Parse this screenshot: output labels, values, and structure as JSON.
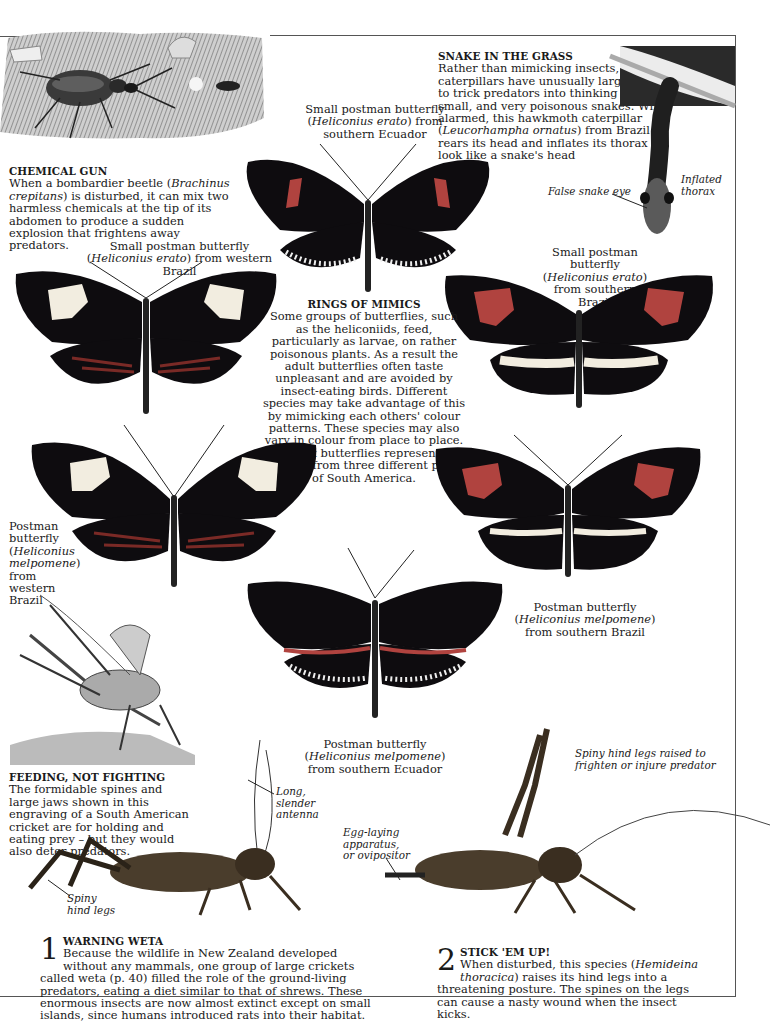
{
  "page": {
    "chemical_gun": {
      "heading": "CHEMICAL GUN",
      "body_pre": "When a bombardier beetle (",
      "species": "Brachinus crepitans",
      "body_post": ") is disturbed, it can mix two harmless chemicals at the tip of its abdomen to produce a sudden explosion that frightens away predators."
    },
    "snake_in_grass": {
      "heading": "SNAKE IN THE GRASS",
      "body_pre": "Rather than mimicking insects, some caterpillars have unusually large heads to trick predators into thinking they are small, and very poisonous snakes. When alarmed, this hawkmoth caterpillar (",
      "species": "Leucorhampha ornatus",
      "body_post": ") from Brazil rears its head and inflates its thorax to look like a snake's head",
      "label_eye": "False snake eye",
      "label_thorax": "Inflated thorax"
    },
    "rings_of_mimics": {
      "heading": "RINGS OF MIMICS",
      "body": "Some groups of butterflies, such as the heliconiids, feed, particularly as larvae, on rather poisonous plants. As a result the adult butterflies often taste unpleasant and are avoided by insect-eating birds. Different species may take advantage of this by mimicking each others' colour patterns. These species may also vary in colour from place to place. These six butterflies represent two species from three different parts of South America."
    },
    "butterflies": [
      {
        "id": "erato-ecuador",
        "common": "Small postman butterfly (",
        "species": "Heliconius erato",
        "region": ") from southern Ecuador"
      },
      {
        "id": "erato-west-brazil",
        "common": "Small postman butterfly (",
        "species": "Heliconius erato",
        "region": ") from western Brazil"
      },
      {
        "id": "erato-south-brazil",
        "common": "Small postman butterfly (",
        "species": "Heliconius erato",
        "region": ") from southern Brazil"
      },
      {
        "id": "melpomene-west-brazil",
        "common": "Postman butterfly (",
        "species": "Heliconius melpomene",
        "region": ") from western Brazil"
      },
      {
        "id": "melpomene-south-brazil",
        "common": "Postman butterfly (",
        "species": "Heliconius melpomene",
        "region": ") from southern Brazil"
      },
      {
        "id": "melpomene-ecuador",
        "common": "Postman butterfly (",
        "species": "Heliconius melpomene",
        "region": ") from southern Ecuador"
      }
    ],
    "feeding": {
      "heading": "FEEDING, NOT FIGHTING",
      "body": "The formidable spines and large jaws shown in this engraving of a South American cricket are for holding and eating prey – but they would also deter predators."
    },
    "weta_labels": {
      "antenna": "Long, slender antenna",
      "hind_legs": "Spiny hind legs",
      "ovipositor": "Egg-laying apparatus, or ovipositor",
      "raised_legs": "Spiny hind legs raised to frighten or injure predator"
    },
    "warning_weta": {
      "number": "1",
      "heading": "WARNING WETA",
      "body": "Because the wildlife in New Zealand developed without any mammals, one group of large crickets called weta (p. 40) filled the role of the ground-living predators, eating a diet similar to that of shrews. These enormous insects are now almost extinct except on small islands, since humans introduced rats into their habitat."
    },
    "stick_em_up": {
      "number": "2",
      "heading": "STICK 'EM UP!",
      "body_pre": "When disturbed, this species (",
      "species": "Hemideina thoracica",
      "body_post": ") raises its hind legs into a threatening posture. The spines on the legs can cause a nasty wound when the insect kicks."
    },
    "colors": {
      "wing_black": "#0e0c0f",
      "band_red": "#b0433f",
      "band_cream": "#f2ede0",
      "frame": "#555555"
    }
  }
}
